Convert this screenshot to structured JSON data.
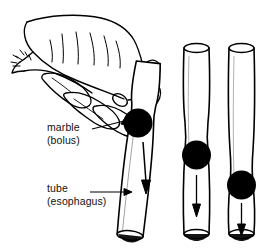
{
  "figure": {
    "kind": "line-drawing-illustration",
    "background_color": "#ffffff",
    "ink_color": "#000000",
    "width": 269,
    "height": 251
  },
  "labels": {
    "marble": {
      "line1": "marble",
      "line2": "(bolus)"
    },
    "tube": {
      "line1": "tube",
      "line2": "(esophagus)"
    }
  },
  "leaders": [
    {
      "name": "marble-leader",
      "from_x": 98,
      "from_y": 130,
      "to_x": 131,
      "to_y": 122
    },
    {
      "name": "tube-leader",
      "from_x": 102,
      "from_y": 192,
      "to_x": 130,
      "to_y": 192
    }
  ],
  "panels": [
    {
      "name": "tube-stage-1",
      "caption_targets": [
        "marble",
        "tube"
      ],
      "has_hand": true,
      "marble_cx": 138,
      "marble_cy": 123,
      "marble_r": 14,
      "arrow_from_y": 140,
      "arrow_to_y": 190,
      "tilt_deg": 6
    },
    {
      "name": "tube-stage-2",
      "has_hand": false,
      "marble_cx": 196,
      "marble_cy": 155,
      "marble_r": 14,
      "arrow_from_y": 175,
      "arrow_to_y": 215,
      "tilt_deg": 0
    },
    {
      "name": "tube-stage-3",
      "has_hand": false,
      "marble_cx": 241,
      "marble_cy": 185,
      "marble_r": 14,
      "arrow_from_y": 203,
      "arrow_to_y": 236,
      "tilt_deg": 0
    }
  ],
  "arrows": {
    "direction": "down",
    "meaning": "direction of bolus travel"
  }
}
